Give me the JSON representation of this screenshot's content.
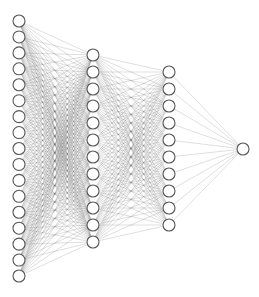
{
  "diagram": {
    "type": "fully-connected-neural-network",
    "layers": [
      {
        "name": "input",
        "nodes": 17,
        "x": 19,
        "y_start": 21,
        "y_end": 276
      },
      {
        "name": "hidden-1",
        "nodes": 12,
        "x": 93,
        "y_start": 55,
        "y_end": 242
      },
      {
        "name": "hidden-2",
        "nodes": 10,
        "x": 169,
        "y_start": 72,
        "y_end": 225
      },
      {
        "name": "output",
        "nodes": 1,
        "x": 243,
        "y_start": 149,
        "y_end": 149
      }
    ],
    "node_radius": 6,
    "colors": {
      "background": "#ffffff",
      "node_fill": "#ffffff",
      "node_stroke": "#555555",
      "edge": "#555555"
    }
  }
}
